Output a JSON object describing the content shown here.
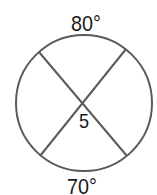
{
  "diagram": {
    "type": "circle-intersecting-chords",
    "circle": {
      "cx": 84,
      "cy": 103,
      "r": 68,
      "stroke": "#5a5a5a",
      "stroke_width": 2
    },
    "chords": [
      {
        "x1": 39,
        "y1": 52,
        "x2": 127,
        "y2": 156
      },
      {
        "x1": 126,
        "y1": 49,
        "x2": 40,
        "y2": 156
      }
    ],
    "labels": {
      "top_arc": "80°",
      "bottom_arc": "70°",
      "angle": "5"
    },
    "colors": {
      "stroke": "#5a5a5a",
      "text": "#1a1a1a",
      "background": "#ffffff"
    }
  }
}
